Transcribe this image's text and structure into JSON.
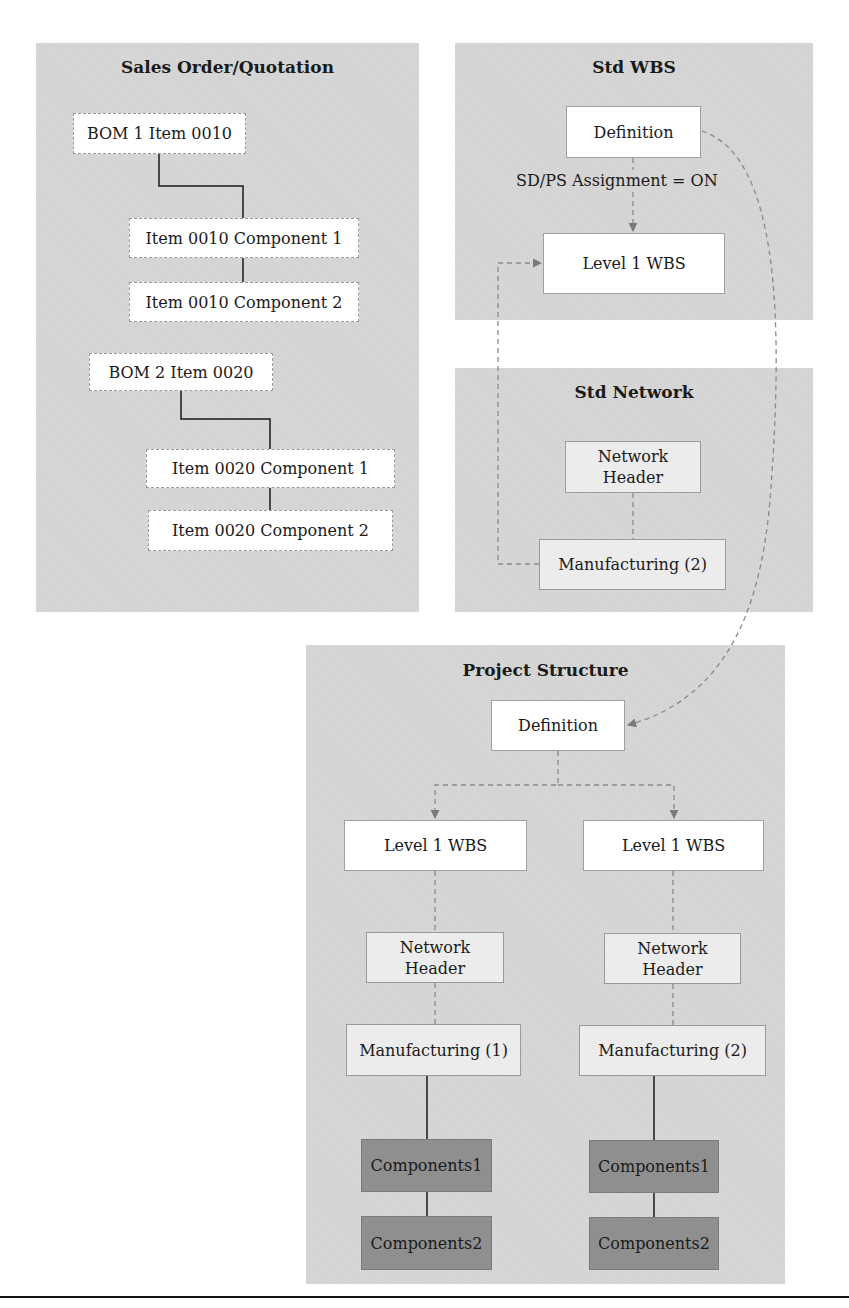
{
  "panels": {
    "sales_order": {
      "title": "Sales Order/Quotation",
      "boms": [
        {
          "label": "BOM 1 Item 0010",
          "components": [
            "Item 0010 Component 1",
            "Item 0010 Component 2"
          ]
        },
        {
          "label": "BOM 2  Item 0020",
          "components": [
            "Item 0020 Component 1",
            "Item 0020 Component 2"
          ]
        }
      ]
    },
    "std_wbs": {
      "title": "Std WBS",
      "definition": "Definition",
      "assignment_label": "SD/PS Assignment = ON",
      "level1": "Level 1 WBS"
    },
    "std_network": {
      "title": "Std Network",
      "header": "Network Header",
      "activity": "Manufacturing (2)"
    },
    "project_structure": {
      "title": "Project Structure",
      "definition": "Definition",
      "branches": [
        {
          "wbs": "Level 1 WBS",
          "header": "Network Header",
          "activity": "Manufacturing (1)",
          "components": [
            "Components1",
            "Components2"
          ]
        },
        {
          "wbs": "Level 1 WBS",
          "header": "Network Header",
          "activity": "Manufacturing (2)",
          "components": [
            "Components1",
            "Components2"
          ]
        }
      ]
    }
  },
  "colors": {
    "panel_bg": "#d4d4d4",
    "box_white": "#ffffff",
    "box_light": "#ececec",
    "box_dark": "#8f8f8f",
    "connector_solid": "#1a1a1a",
    "connector_dashed": "#8a8a8a"
  }
}
